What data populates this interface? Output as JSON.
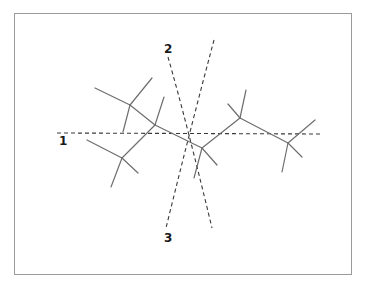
{
  "diagram": {
    "type": "molecular skeleton with symmetry axes",
    "frame": {
      "x": 14,
      "y": 13,
      "width": 338,
      "height": 262,
      "border_color": "#9a9a9a"
    },
    "colors": {
      "bond": "#6e6e6e",
      "axis": "#3a3a3a",
      "label": "#1a1a1a",
      "background": "#ffffff"
    },
    "axes": [
      {
        "id": "1",
        "label": "1",
        "label_pos": [
          59,
          145
        ],
        "style": "dashed",
        "path": [
          [
            57,
            133
          ],
          [
            323,
            134
          ]
        ]
      },
      {
        "id": "2",
        "label": "2",
        "label_pos": [
          164,
          53
        ],
        "style": "dashed",
        "path": [
          [
            168,
            57
          ],
          [
            186,
            120
          ],
          [
            212,
            228
          ]
        ]
      },
      {
        "id": "3",
        "label": "3",
        "label_pos": [
          164,
          242
        ],
        "style": "dashed",
        "path": [
          [
            214,
            40
          ],
          [
            190,
            130
          ],
          [
            166,
            228
          ]
        ]
      }
    ],
    "nodes": [
      {
        "id": "A",
        "x": 130,
        "y": 105
      },
      {
        "id": "B",
        "x": 155,
        "y": 125
      },
      {
        "id": "C",
        "x": 122,
        "y": 158
      },
      {
        "id": "D",
        "x": 202,
        "y": 148
      },
      {
        "id": "E",
        "x": 240,
        "y": 118
      },
      {
        "id": "F",
        "x": 288,
        "y": 143
      }
    ],
    "bonds": [
      {
        "from": [
          130,
          105
        ],
        "to": [
          95,
          88
        ]
      },
      {
        "from": [
          130,
          105
        ],
        "to": [
          152,
          78
        ]
      },
      {
        "from": [
          130,
          105
        ],
        "to": [
          123,
          132
        ]
      },
      {
        "from": [
          130,
          105
        ],
        "to": [
          155,
          125
        ]
      },
      {
        "from": [
          155,
          125
        ],
        "to": [
          164,
          97
        ]
      },
      {
        "from": [
          155,
          125
        ],
        "to": [
          122,
          158
        ]
      },
      {
        "from": [
          122,
          158
        ],
        "to": [
          87,
          140
        ]
      },
      {
        "from": [
          122,
          158
        ],
        "to": [
          138,
          173
        ]
      },
      {
        "from": [
          122,
          158
        ],
        "to": [
          111,
          187
        ]
      },
      {
        "from": [
          155,
          125
        ],
        "to": [
          202,
          148
        ]
      },
      {
        "from": [
          202,
          148
        ],
        "to": [
          217,
          165
        ]
      },
      {
        "from": [
          202,
          148
        ],
        "to": [
          194,
          178
        ]
      },
      {
        "from": [
          202,
          148
        ],
        "to": [
          240,
          118
        ]
      },
      {
        "from": [
          240,
          118
        ],
        "to": [
          228,
          104
        ]
      },
      {
        "from": [
          240,
          118
        ],
        "to": [
          246,
          90
        ]
      },
      {
        "from": [
          240,
          118
        ],
        "to": [
          288,
          143
        ]
      },
      {
        "from": [
          288,
          143
        ],
        "to": [
          315,
          120
        ]
      },
      {
        "from": [
          288,
          143
        ],
        "to": [
          302,
          157
        ]
      },
      {
        "from": [
          288,
          143
        ],
        "to": [
          282,
          172
        ]
      }
    ]
  }
}
